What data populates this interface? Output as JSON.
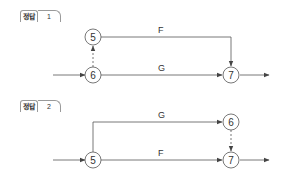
{
  "diagrams": [
    {
      "badge": {
        "label": "정답",
        "number": "1"
      },
      "nodes": [
        {
          "id": "5",
          "label": "5"
        },
        {
          "id": "6",
          "label": "6"
        },
        {
          "id": "7",
          "label": "7"
        }
      ],
      "edges": [
        {
          "from": "start",
          "to": "6",
          "label": "",
          "style": "solid"
        },
        {
          "from": "6",
          "to": "5",
          "label": "",
          "style": "dashed"
        },
        {
          "from": "5",
          "to": "7",
          "label": "F",
          "style": "solid"
        },
        {
          "from": "6",
          "to": "7",
          "label": "G",
          "style": "solid"
        },
        {
          "from": "7",
          "to": "end",
          "label": "",
          "style": "solid"
        }
      ]
    },
    {
      "badge": {
        "label": "정답",
        "number": "2"
      },
      "nodes": [
        {
          "id": "5",
          "label": "5"
        },
        {
          "id": "6",
          "label": "6"
        },
        {
          "id": "7",
          "label": "7"
        }
      ],
      "edges": [
        {
          "from": "start",
          "to": "5",
          "label": "",
          "style": "solid"
        },
        {
          "from": "5",
          "to": "6",
          "label": "G",
          "style": "solid"
        },
        {
          "from": "5",
          "to": "7",
          "label": "F",
          "style": "solid"
        },
        {
          "from": "6",
          "to": "7",
          "label": "",
          "style": "dashed"
        },
        {
          "from": "7",
          "to": "end",
          "label": "",
          "style": "solid"
        }
      ]
    }
  ],
  "colors": {
    "line": "#555555",
    "text": "#333333",
    "badge_border": "#9a9a9a"
  }
}
